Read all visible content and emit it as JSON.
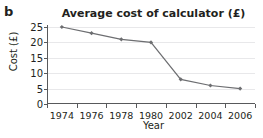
{
  "part_label": "b",
  "axis": {
    "y_ticks": [
      0,
      5,
      10,
      15,
      20,
      25
    ],
    "x_ticks": [
      "1974",
      "1976",
      "1978",
      "1980",
      "2002",
      "2004",
      "2006"
    ]
  },
  "colors": {
    "line": "#6d6e71",
    "marker": "#6d6e71",
    "axis": "#58595b",
    "grid": "#e8e8ea",
    "text": "#231f20"
  },
  "chart_data": {
    "type": "line",
    "title": "Average cost of calculator (£)",
    "xlabel": "Year",
    "ylabel": "Cost (£)",
    "categories": [
      "1974",
      "1976",
      "1978",
      "1980",
      "2002",
      "2004",
      "2006"
    ],
    "values": [
      25,
      23,
      21,
      20,
      8,
      6,
      5
    ],
    "ylim": [
      0,
      25
    ],
    "ytick_step": 5,
    "grid": true,
    "legend": null,
    "markers": "diamond"
  }
}
